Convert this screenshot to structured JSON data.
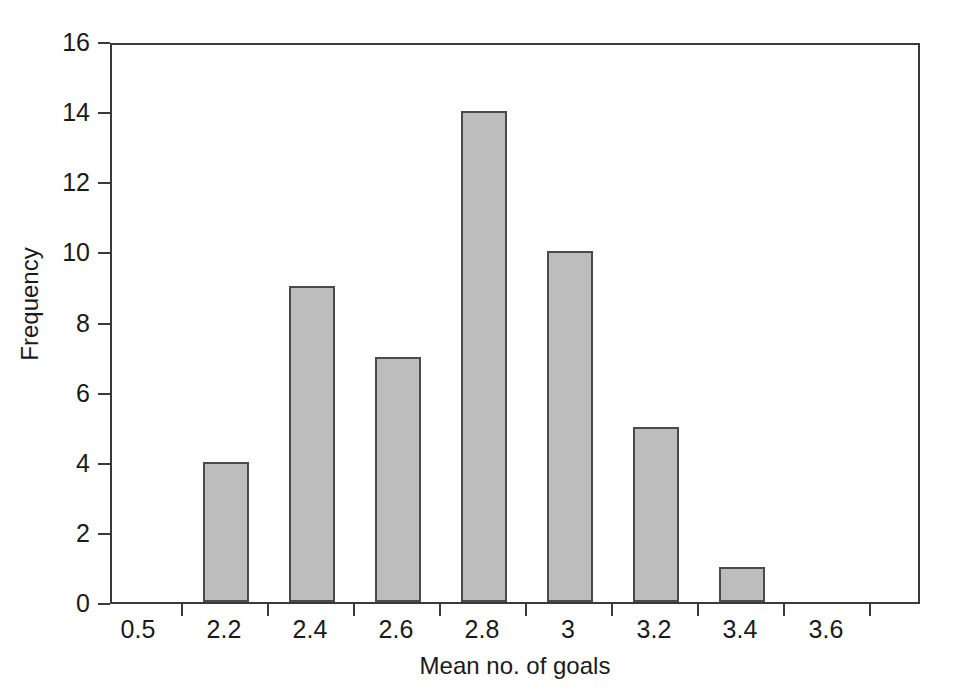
{
  "chart_data": {
    "type": "bar",
    "title": "",
    "subtitle": "",
    "xlabel": "Mean no. of goals",
    "ylabel": "Frequency",
    "categories": [
      "0.5",
      "2.2",
      "2.4",
      "2.6",
      "2.8",
      "3",
      "3.2",
      "3.4",
      "3.6"
    ],
    "values": [
      0,
      4,
      9,
      7,
      14,
      10,
      5,
      1,
      0
    ],
    "series": [
      {
        "name": "Frequency",
        "values": [
          0,
          4,
          9,
          7,
          14,
          10,
          5,
          1,
          0
        ]
      }
    ],
    "xtick_labels": [
      "0.5",
      "2.2",
      "2.4",
      "2.6",
      "2.8",
      "3",
      "3.2",
      "3.4",
      "3.6"
    ],
    "ytick_labels": [
      "0",
      "2",
      "4",
      "6",
      "8",
      "10",
      "12",
      "14",
      "16"
    ],
    "ytick_values": [
      0,
      2,
      4,
      6,
      8,
      10,
      12,
      14,
      16
    ],
    "ylim": [
      0,
      16
    ],
    "grid": false,
    "legend": false,
    "legend_position": "none",
    "bar_fill_color": "#bdbdbd",
    "bar_edge_color": "#4a4a4a",
    "axis_color": "#3a3a3a",
    "background_color": "#ffffff",
    "annotations": []
  }
}
